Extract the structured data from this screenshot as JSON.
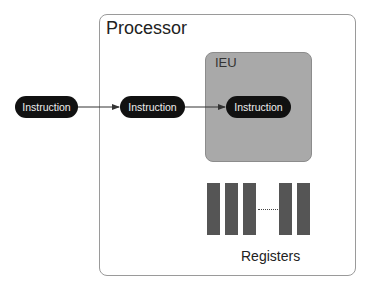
{
  "diagram": {
    "processor": {
      "label": "Processor"
    },
    "ieu": {
      "label": "IEU"
    },
    "instructions": [
      {
        "label": "Instruction",
        "location": "outside"
      },
      {
        "label": "Instruction",
        "location": "processor"
      },
      {
        "label": "Instruction",
        "location": "ieu"
      }
    ],
    "registers": {
      "label": "Registers",
      "ellipsis": "....."
    },
    "colors": {
      "pill": "#111111",
      "ieu": "#a9a9a9",
      "register": "#555555",
      "border": "#9a9a9a"
    }
  }
}
